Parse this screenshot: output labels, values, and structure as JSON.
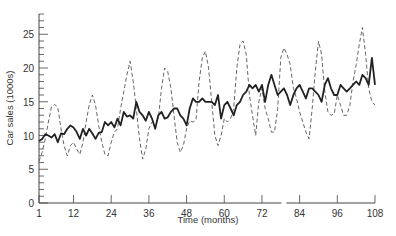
{
  "chart_data": {
    "type": "line",
    "title": "",
    "xlabel": "Time (months)",
    "ylabel": "Car sales (1000s)",
    "xlim": [
      1,
      108
    ],
    "ylim": [
      0,
      28
    ],
    "x_ticks": [
      1,
      12,
      24,
      36,
      48,
      60,
      72,
      84,
      96,
      108
    ],
    "y_ticks": [
      0,
      5,
      10,
      15,
      20,
      25
    ],
    "grid": false,
    "legend": null,
    "x": [
      1,
      2,
      3,
      4,
      5,
      6,
      7,
      8,
      9,
      10,
      11,
      12,
      13,
      14,
      15,
      16,
      17,
      18,
      19,
      20,
      21,
      22,
      23,
      24,
      25,
      26,
      27,
      28,
      29,
      30,
      31,
      32,
      33,
      34,
      35,
      36,
      37,
      38,
      39,
      40,
      41,
      42,
      43,
      44,
      45,
      46,
      47,
      48,
      49,
      50,
      51,
      52,
      53,
      54,
      55,
      56,
      57,
      58,
      59,
      60,
      61,
      62,
      63,
      64,
      65,
      66,
      67,
      68,
      69,
      70,
      71,
      72,
      73,
      74,
      75,
      76,
      77,
      78,
      79,
      80,
      81,
      82,
      83,
      84,
      85,
      86,
      87,
      88,
      89,
      90,
      91,
      92,
      93,
      94,
      95,
      96,
      97,
      98,
      99,
      100,
      101,
      102,
      103,
      104,
      105,
      106,
      107,
      108
    ],
    "series": [
      {
        "name": "Car sales (actual)",
        "style": "dashed",
        "values": [
          6.2,
          7.5,
          9.5,
          12.0,
          14.3,
          14.6,
          14.2,
          11.0,
          8.5,
          7.0,
          8.5,
          9.0,
          8.0,
          7.2,
          9.0,
          12.0,
          14.5,
          16.0,
          14.5,
          11.5,
          9.0,
          7.2,
          7.0,
          9.0,
          10.5,
          11.0,
          14.0,
          16.5,
          19.0,
          21.0,
          18.0,
          14.0,
          9.5,
          6.5,
          8.0,
          11.0,
          12.0,
          12.0,
          12.5,
          17.0,
          20.0,
          19.5,
          17.0,
          13.0,
          9.0,
          7.5,
          8.5,
          11.0,
          12.2,
          12.0,
          12.3,
          18.0,
          21.5,
          22.5,
          20.0,
          15.0,
          10.0,
          8.5,
          10.0,
          12.5,
          12.0,
          12.5,
          14.0,
          20.0,
          23.5,
          24.0,
          22.0,
          16.0,
          13.0,
          10.0,
          15.0,
          17.0,
          14.0,
          12.5,
          10.5,
          10.5,
          14.0,
          21.5,
          23.0,
          22.0,
          20.5,
          17.0,
          15.5,
          13.5,
          12.0,
          10.5,
          9.5,
          14.0,
          19.5,
          24.0,
          22.0,
          16.5,
          13.5,
          13.0,
          13.2,
          16.0,
          14.5,
          13.0,
          13.0,
          14.5,
          18.0,
          20.5,
          23.5,
          26.0,
          22.0,
          17.0,
          15.0,
          14.5
        ]
      },
      {
        "name": "Car sales (deseasonalised)",
        "style": "solid",
        "values": [
          9.2,
          9.5,
          10.2,
          10.0,
          9.7,
          10.2,
          9.0,
          10.3,
          10.2,
          11.0,
          11.5,
          11.2,
          10.5,
          9.5,
          11.0,
          10.0,
          11.0,
          10.3,
          9.5,
          10.4,
          10.5,
          12.0,
          11.5,
          12.0,
          11.2,
          12.5,
          11.5,
          13.5,
          12.8,
          13.0,
          12.5,
          15.0,
          13.5,
          13.0,
          12.2,
          13.5,
          12.5,
          11.0,
          13.0,
          13.5,
          12.5,
          12.7,
          13.5,
          14.0,
          14.0,
          13.0,
          12.5,
          11.5,
          14.0,
          15.5,
          15.0,
          15.0,
          15.5,
          15.0,
          15.0,
          15.0,
          14.5,
          16.0,
          12.5,
          14.5,
          15.0,
          14.0,
          13.0,
          14.5,
          15.0,
          16.0,
          16.5,
          17.5,
          17.0,
          17.5,
          16.5,
          17.5,
          15.0,
          17.5,
          19.0,
          17.5,
          16.0,
          16.5,
          17.0,
          16.0,
          14.5,
          16.0,
          17.0,
          17.5,
          16.5,
          15.5,
          17.0,
          17.0,
          16.5,
          16.0,
          15.0,
          17.5,
          18.5,
          17.0,
          16.0,
          16.0,
          17.5,
          17.0,
          16.5,
          17.0,
          17.5,
          18.0,
          17.5,
          19.0,
          18.5,
          17.5,
          21.5,
          17.5
        ]
      }
    ]
  },
  "axis_labels": {
    "x": "Time (months)",
    "y": "Car sales (1000s)"
  }
}
